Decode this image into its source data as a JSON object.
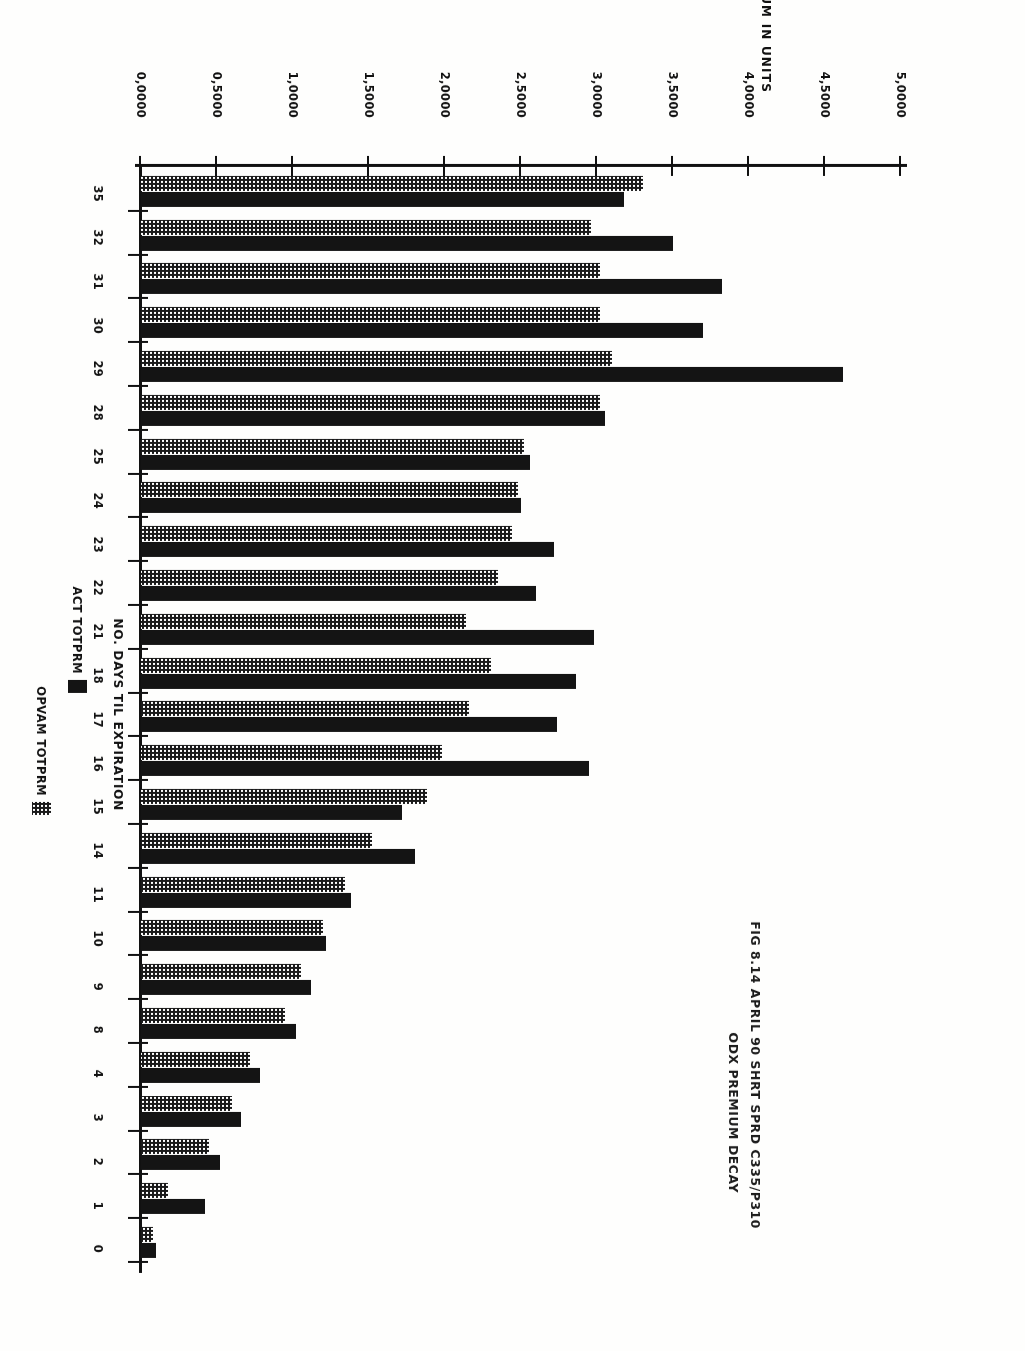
{
  "figure": {
    "title_line1": "FIG 8.14 APRIL 90 SHRT SPRD C335/P310",
    "title_line2": "ODX PREMIUM DECAY"
  },
  "chart_data": {
    "type": "bar",
    "orientation": "horizontal",
    "xlabel": "NO. DAYS TIL EXPIRATION",
    "ylabel": "TOTAL PREMIUM IN UNITS",
    "ylim": [
      0.0,
      5.0
    ],
    "ytick_labels": [
      "0,0000",
      "0,5000",
      "1,0000",
      "1,5000",
      "2,0000",
      "2,5000",
      "3,0000",
      "3,5000",
      "4,0000",
      "4,5000",
      "5,0000"
    ],
    "ytick_values": [
      0.0,
      0.5,
      1.0,
      1.5,
      2.0,
      2.5,
      3.0,
      3.5,
      4.0,
      4.5,
      5.0
    ],
    "grid": false,
    "legend_position": "bottom-right",
    "categories": [
      "0",
      "1",
      "2",
      "3",
      "4",
      "8",
      "9",
      "10",
      "11",
      "14",
      "15",
      "16",
      "17",
      "18",
      "21",
      "22",
      "23",
      "24",
      "25",
      "28",
      "29",
      "30",
      "31",
      "32",
      "35"
    ],
    "series": [
      {
        "name": "ACT TOTPRM",
        "style": "solid-black",
        "color": "#141414",
        "values": [
          0.1,
          0.42,
          0.52,
          0.66,
          0.78,
          1.02,
          1.12,
          1.22,
          1.38,
          1.8,
          1.72,
          2.95,
          2.74,
          2.86,
          2.98,
          2.6,
          2.72,
          2.5,
          2.56,
          3.05,
          4.62,
          3.7,
          3.82,
          3.5,
          3.18
        ]
      },
      {
        "name": "OPVAM TOTPRM",
        "style": "dotted-fill",
        "color": "#1a1a1a",
        "values": [
          0.08,
          0.18,
          0.45,
          0.6,
          0.72,
          0.95,
          1.05,
          1.2,
          1.34,
          1.52,
          1.88,
          1.98,
          2.16,
          2.3,
          2.14,
          2.35,
          2.44,
          2.48,
          2.52,
          3.02,
          3.1,
          3.02,
          3.02,
          2.96,
          3.3
        ]
      }
    ]
  },
  "legend": {
    "entries": [
      {
        "label": "ACT TOTPRM",
        "swatch": "solid-black"
      },
      {
        "label": "OPVAM TOTPRM",
        "swatch": "dotted-fill"
      }
    ]
  }
}
